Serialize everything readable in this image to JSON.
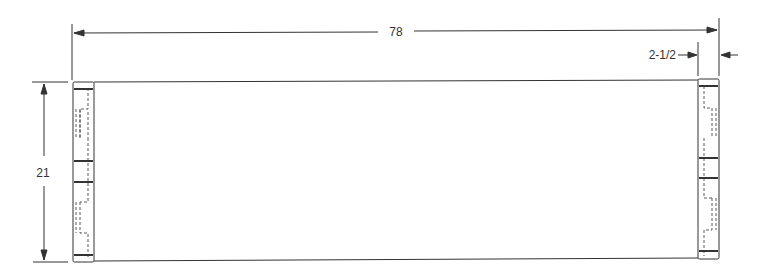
{
  "drawing": {
    "type": "technical-drawing",
    "view": "top view of panel with end caps",
    "dimensions": {
      "overall_length": "78",
      "height": "21",
      "end_cap_width": "2-1/2"
    },
    "colors": {
      "line": "#333333",
      "background": "#ffffff"
    }
  }
}
